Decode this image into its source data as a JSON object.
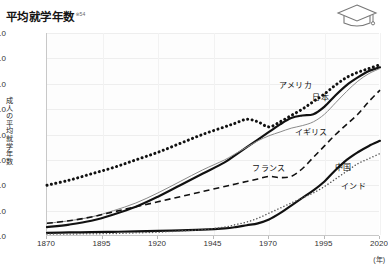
{
  "header": {
    "title": "平均就学年数",
    "title_note": "※54",
    "icon": "graduation-cap-icon"
  },
  "chart_data": {
    "type": "line",
    "title": "平均就学年数",
    "xlabel": "(年)",
    "ylabel": "成人の平均就学年数",
    "xlim": [
      1870,
      2020
    ],
    "ylim": [
      0.0,
      16.0
    ],
    "grid": true,
    "legend": "inline-labels",
    "xticks": [
      "1870",
      "1895",
      "1920",
      "1945",
      "1970",
      "1995",
      "2020"
    ],
    "yticks": [
      "0.0",
      "2.0",
      "4.0",
      "6.0",
      "8.0",
      "10.0",
      "12.0",
      "14.0",
      "16.0"
    ],
    "x": [
      1870,
      1880,
      1890,
      1900,
      1910,
      1920,
      1930,
      1940,
      1950,
      1955,
      1960,
      1965,
      1970,
      1975,
      1980,
      1985,
      1990,
      1995,
      2000,
      2005,
      2010,
      2015,
      2020
    ],
    "series": [
      {
        "name": "アメリカ",
        "style": "dotted-thick",
        "color": "#111111",
        "label_x": 1975,
        "label_y": 12.0,
        "values": [
          4.0,
          4.4,
          4.9,
          5.4,
          6.0,
          6.6,
          7.3,
          8.0,
          8.6,
          8.9,
          9.2,
          9.0,
          8.6,
          9.0,
          9.5,
          10.0,
          10.6,
          11.2,
          11.9,
          12.5,
          12.9,
          13.2,
          13.5
        ]
      },
      {
        "name": "日本",
        "style": "solid-thick",
        "color": "#111111",
        "label_x": 1990,
        "label_y": 11.0,
        "values": [
          0.7,
          0.9,
          1.2,
          1.7,
          2.3,
          3.1,
          4.0,
          4.9,
          5.8,
          6.4,
          7.0,
          7.6,
          8.2,
          8.8,
          9.3,
          9.5,
          9.6,
          10.2,
          11.1,
          11.9,
          12.5,
          13.0,
          13.3
        ]
      },
      {
        "name": "イギリス",
        "style": "solid-thin",
        "color": "#8a8a8a",
        "label_x": 1982,
        "label_y": 8.3,
        "values": [
          1.0,
          1.2,
          1.5,
          2.0,
          2.6,
          3.4,
          4.3,
          5.2,
          6.0,
          6.5,
          7.0,
          7.5,
          7.9,
          8.2,
          8.5,
          8.7,
          9.0,
          9.6,
          10.5,
          11.4,
          12.2,
          12.8,
          13.2
        ]
      },
      {
        "name": "フランス",
        "style": "dashed",
        "color": "#111111",
        "label_x": 1963,
        "label_y": 5.4,
        "values": [
          1.0,
          1.2,
          1.5,
          1.9,
          2.3,
          2.7,
          3.1,
          3.5,
          3.9,
          4.1,
          4.3,
          4.5,
          4.7,
          4.6,
          4.7,
          5.3,
          6.2,
          7.1,
          8.0,
          8.8,
          9.6,
          10.6,
          11.5
        ]
      },
      {
        "name": "中国",
        "style": "solid-thick",
        "color": "#111111",
        "label_x": 2000,
        "label_y": 5.5,
        "values": [
          0.25,
          0.28,
          0.3,
          0.33,
          0.36,
          0.4,
          0.45,
          0.5,
          0.6,
          0.7,
          0.85,
          1.0,
          1.3,
          1.8,
          2.4,
          3.0,
          3.6,
          4.3,
          5.2,
          6.0,
          6.6,
          7.1,
          7.5
        ]
      },
      {
        "name": "インド",
        "style": "dotted-fine",
        "color": "#555555",
        "label_x": 2003,
        "label_y": 4.0,
        "values": [
          0.15,
          0.16,
          0.18,
          0.2,
          0.25,
          0.3,
          0.4,
          0.5,
          0.7,
          0.9,
          1.1,
          1.4,
          1.8,
          2.2,
          2.6,
          3.0,
          3.4,
          3.9,
          4.5,
          5.1,
          5.7,
          6.1,
          6.5
        ]
      }
    ]
  }
}
